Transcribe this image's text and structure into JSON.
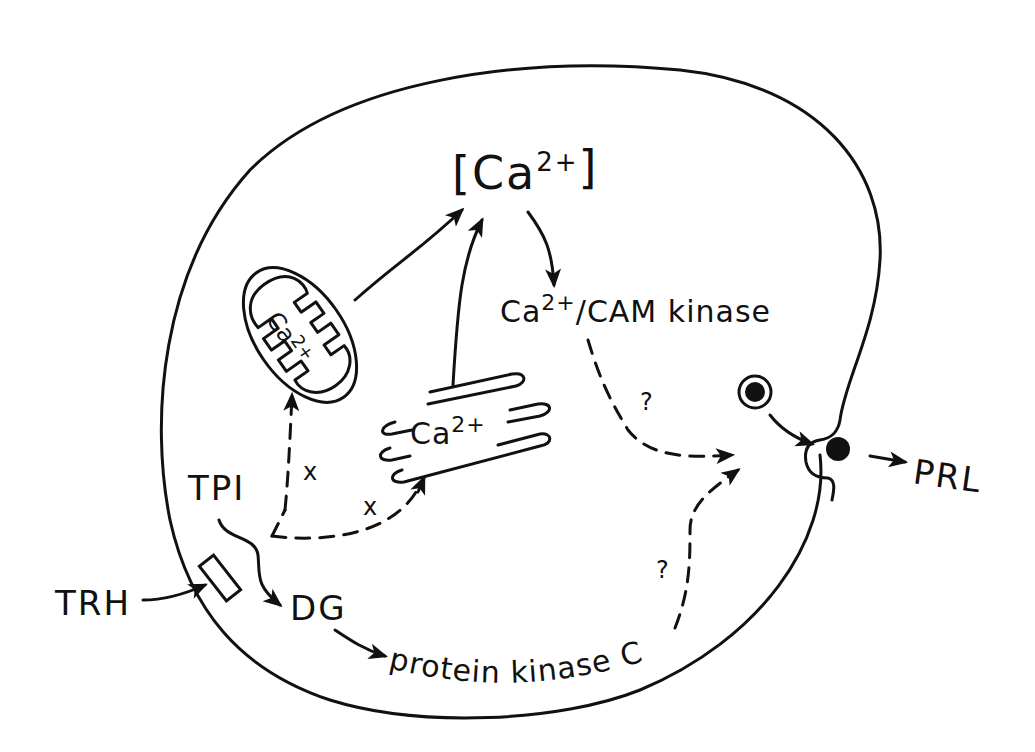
{
  "diagram": {
    "labels": {
      "ca_pool": "[Ca",
      "ca_pool_sup": "2+",
      "ca_pool_close": "]",
      "camk_main": "Ca",
      "camk_sup": "2+",
      "camk_rest": "/CAM kinase",
      "mito_ca": "Ca",
      "mito_sup": "2+",
      "er_ca": "Ca",
      "er_sup": "2+",
      "tpi": "TPI",
      "dg": "DG",
      "trh": "TRH",
      "pkc": "protein kinase C",
      "prl": "PRL",
      "x1": "x",
      "x2": "x",
      "q1": "?",
      "q2": "?"
    },
    "nodes": [
      {
        "id": "trh",
        "label": "TRH"
      },
      {
        "id": "receptor",
        "label": ""
      },
      {
        "id": "tpi",
        "label": "TPI"
      },
      {
        "id": "dg",
        "label": "DG"
      },
      {
        "id": "pkc",
        "label": "protein kinase C"
      },
      {
        "id": "mitochondrion",
        "label": "Ca2+"
      },
      {
        "id": "er",
        "label": "Ca2+"
      },
      {
        "id": "ca_pool",
        "label": "[Ca2+]"
      },
      {
        "id": "camk",
        "label": "Ca2+/CAM kinase"
      },
      {
        "id": "granule",
        "label": ""
      },
      {
        "id": "exocytosis",
        "label": ""
      },
      {
        "id": "prl",
        "label": "PRL"
      }
    ],
    "edges": [
      {
        "from": "trh",
        "to": "receptor",
        "style": "solid"
      },
      {
        "from": "tpi",
        "to": "dg",
        "style": "solid"
      },
      {
        "from": "tpi",
        "to": "mitochondrion",
        "style": "dashed",
        "label": "x"
      },
      {
        "from": "tpi",
        "to": "er",
        "style": "dashed",
        "label": "x"
      },
      {
        "from": "mitochondrion",
        "to": "ca_pool",
        "style": "solid"
      },
      {
        "from": "er",
        "to": "ca_pool",
        "style": "solid"
      },
      {
        "from": "ca_pool",
        "to": "camk",
        "style": "solid"
      },
      {
        "from": "camk",
        "to": "exocytosis",
        "style": "dashed",
        "label": "?"
      },
      {
        "from": "dg",
        "to": "pkc",
        "style": "solid"
      },
      {
        "from": "pkc",
        "to": "exocytosis",
        "style": "dashed",
        "label": "?"
      },
      {
        "from": "granule",
        "to": "exocytosis",
        "style": "solid"
      },
      {
        "from": "exocytosis",
        "to": "prl",
        "style": "solid"
      }
    ]
  }
}
